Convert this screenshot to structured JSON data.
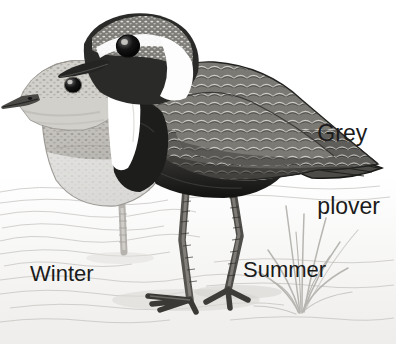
{
  "illustration": {
    "subject": "Grey plover",
    "species_label": "Grey plover",
    "title_line_1": "Grey",
    "title_line_2": "plover",
    "style": "grayscale field-guide bird illustration",
    "background_color": "#ffffff",
    "text_color": "#1b1b1b"
  },
  "labels": {
    "title": "Grey plover",
    "winter": "Winter",
    "summer": "Summer"
  },
  "birds": [
    {
      "name": "winter-plumage-plover",
      "plumage": "Winter",
      "position": "front-left",
      "description": "pale mottled grey-brown plover with speckled crown, short dark bill, pale streaked breast",
      "body_color": "#c9c7c2",
      "crown_color": "#9a968f",
      "bill_color": "#3a3a3a"
    },
    {
      "name": "summer-plumage-plover",
      "plumage": "Summer",
      "position": "rear-right",
      "description": "black-faced plover with white supercilium and neck stripe, scalloped grey-and-white back, black breast and belly",
      "face_color": "#2a2a2a",
      "neck_stripe_color": "#ffffff",
      "back_color": "#7d7b76",
      "belly_color": "#1e1e1e",
      "leg_color": "#5c5a56"
    }
  ],
  "scene": {
    "ground": "wet sand and shallow water with faint ripple contour lines",
    "ground_color": "#f2f1ef",
    "ripple_color": "#b9b7b3",
    "grass_tuft": "pale grey beach grass tuft at right",
    "grass_color": "#b5b3ae",
    "shadow_color": "#d9d7d3"
  }
}
